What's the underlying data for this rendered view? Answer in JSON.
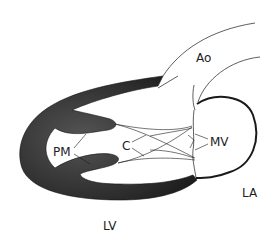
{
  "diagram": {
    "labels": {
      "ao": "Ao",
      "pm": "PM",
      "c": "C",
      "mv": "MV",
      "la": "LA",
      "lv": "LV"
    },
    "colors": {
      "wall": "#2e2e2e",
      "line": "#1a1a1a",
      "background": "#ffffff"
    }
  }
}
